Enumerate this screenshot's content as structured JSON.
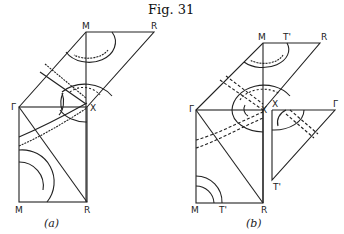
{
  "figure": {
    "title": "Fig. 31",
    "panels": [
      {
        "caption": "(a)",
        "labels": {
          "M_top": "M",
          "R_top": "R",
          "Gamma": "Γ",
          "X": "X",
          "M_bottom": "M",
          "R_bottom": "R"
        }
      },
      {
        "caption": "(b)",
        "labels": {
          "M_top": "M",
          "T_top": "T'",
          "R_top": "R",
          "Gamma": "Γ",
          "X": "X",
          "M_bottom": "M",
          "T_bottom": "T'",
          "R_bottom": "R",
          "X_right": "X",
          "Gamma_right": "Γ",
          "T_right": "T'"
        }
      }
    ]
  }
}
